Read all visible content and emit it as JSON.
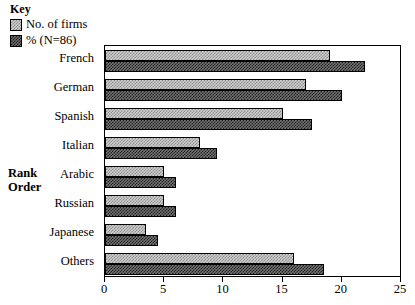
{
  "legend": {
    "title": "Key",
    "entries": [
      {
        "label": "No. of firms",
        "swatch": "light-checker-swatch",
        "color": "#b0b0b0"
      },
      {
        "label": "% (N=86)",
        "swatch": "dark-checker-swatch",
        "color": "#555555"
      }
    ]
  },
  "axis_title": {
    "line1": "Rank",
    "line2": "Order"
  },
  "chart_data": {
    "type": "bar",
    "orientation": "horizontal",
    "title": "",
    "xlabel": "",
    "ylabel": "Rank Order",
    "xlim": [
      0,
      25
    ],
    "xticks": [
      0,
      5,
      10,
      15,
      20,
      25
    ],
    "xtick_labels": [
      "0",
      "5",
      "10",
      "15",
      "20",
      "25"
    ],
    "grid": false,
    "legend_position": "top-left-outside",
    "categories": [
      "French",
      "German",
      "Spanish",
      "Italian",
      "Arabic",
      "Russian",
      "Japanese",
      "Others"
    ],
    "series": [
      {
        "name": "No. of firms",
        "values": [
          19,
          17,
          15,
          8,
          5,
          5,
          3.5,
          16
        ]
      },
      {
        "name": "% (N=86)",
        "values": [
          22,
          20,
          17.5,
          9.5,
          6,
          6,
          4.5,
          18.5
        ]
      }
    ]
  }
}
